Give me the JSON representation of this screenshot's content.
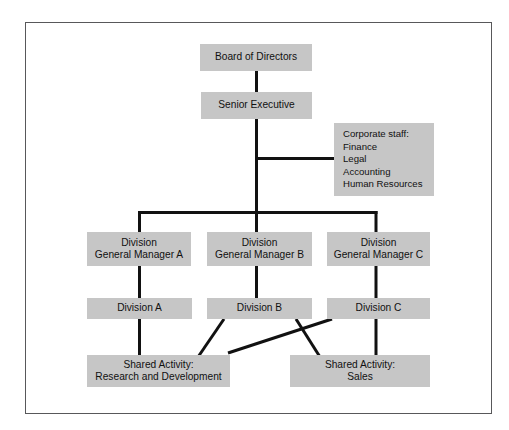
{
  "diagram": {
    "type": "organizational-chart",
    "title": "",
    "colors": {
      "node_fill": "#c6c6c6",
      "node_text": "#111111",
      "connector": "#111111",
      "frame_border": "#58585a",
      "background": "#ffffff"
    },
    "nodes": [
      {
        "id": "board",
        "label": "Board of Directors",
        "level": 0
      },
      {
        "id": "senior",
        "label": "Senior Executive",
        "level": 1
      },
      {
        "id": "corporate",
        "label": "Corporate staff:\nFinance\nLegal\nAccounting\nHuman Resources",
        "level": 2
      },
      {
        "id": "gm_a",
        "label": "Division\nGeneral Manager A",
        "level": 3
      },
      {
        "id": "gm_b",
        "label": "Division\nGeneral Manager B",
        "level": 3
      },
      {
        "id": "gm_c",
        "label": "Division\nGeneral Manager C",
        "level": 3
      },
      {
        "id": "div_a",
        "label": "Division A",
        "level": 4
      },
      {
        "id": "div_b",
        "label": "Division B",
        "level": 4
      },
      {
        "id": "div_c",
        "label": "Division C",
        "level": 4
      },
      {
        "id": "shared_rd",
        "label": "Shared Activity:\nResearch and Development",
        "level": 5
      },
      {
        "id": "shared_sales",
        "label": "Shared Activity:\nSales",
        "level": 5
      }
    ],
    "edges": [
      {
        "from": "board",
        "to": "senior",
        "style": "straight"
      },
      {
        "from": "senior",
        "to": "corporate",
        "style": "staff-branch"
      },
      {
        "from": "senior",
        "to": "gm_a",
        "style": "elbow"
      },
      {
        "from": "senior",
        "to": "gm_b",
        "style": "straight"
      },
      {
        "from": "senior",
        "to": "gm_c",
        "style": "elbow"
      },
      {
        "from": "gm_a",
        "to": "div_a",
        "style": "straight"
      },
      {
        "from": "gm_b",
        "to": "div_b",
        "style": "straight"
      },
      {
        "from": "gm_c",
        "to": "div_c",
        "style": "straight"
      },
      {
        "from": "div_a",
        "to": "shared_rd",
        "style": "straight"
      },
      {
        "from": "div_b",
        "to": "shared_rd",
        "style": "diagonal"
      },
      {
        "from": "div_b",
        "to": "shared_sales",
        "style": "diagonal"
      },
      {
        "from": "div_c",
        "to": "shared_rd",
        "style": "diagonal"
      },
      {
        "from": "div_c",
        "to": "shared_sales",
        "style": "straight"
      }
    ]
  }
}
